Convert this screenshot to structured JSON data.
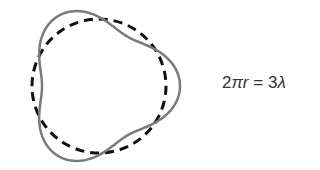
{
  "diagram": {
    "circle": {
      "cx": 99,
      "cy": 86,
      "r": 67,
      "style": "dashed",
      "color": "#111111"
    },
    "wave": {
      "cx": 99,
      "cy": 86,
      "base_radius": 69,
      "amplitude": 12,
      "lobes": 3,
      "style": "solid",
      "color": "#7a7a7a"
    }
  },
  "equation": {
    "lhs_coeff": "2",
    "lhs_pi": "π",
    "lhs_r": "r",
    "equals": " = ",
    "rhs_coeff": "3",
    "rhs_lambda": "λ",
    "full_text": "2πr = 3λ"
  }
}
